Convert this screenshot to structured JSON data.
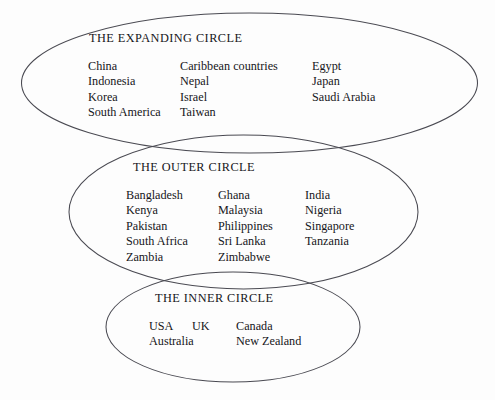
{
  "diagram": {
    "background_color": "#fdfdfd",
    "stroke_color": "#4a4a52",
    "text_color": "#16161a"
  },
  "circles": [
    {
      "id": "expanding",
      "label": "THE EXPANDING CIRCLE",
      "columns": [
        [
          "China",
          "Indonesia",
          "Korea",
          "South America"
        ],
        [
          "Caribbean countries",
          "Nepal",
          "Israel",
          "Taiwan"
        ],
        [
          "Egypt",
          "Japan",
          "Saudi Arabia"
        ]
      ]
    },
    {
      "id": "outer",
      "label": "THE OUTER CIRCLE",
      "columns": [
        [
          "Bangladesh",
          "Kenya",
          "Pakistan",
          "South Africa",
          "Zambia"
        ],
        [
          "Ghana",
          "Malaysia",
          "Philippines",
          "Sri Lanka",
          "Zimbabwe"
        ],
        [
          "India",
          "Nigeria",
          "Singapore",
          "Tanzania"
        ]
      ]
    },
    {
      "id": "inner",
      "label": "THE INNER CIRCLE",
      "columns": [
        [
          "USA",
          "Australia"
        ],
        [
          "UK"
        ],
        [
          "Canada",
          "New Zealand"
        ]
      ]
    }
  ]
}
